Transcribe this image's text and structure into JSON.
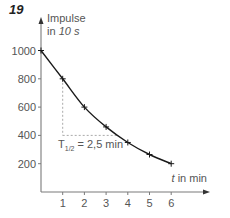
{
  "figure": {
    "number": "19"
  },
  "chart_data": {
    "type": "line",
    "title": "",
    "ylabel": "Impulse in 10 s",
    "ylabel_parts": {
      "main": "Impulse",
      "line2_prefix": "in ",
      "line2_italic": "10 s"
    },
    "xlabel": "t in min",
    "xlabel_parts": {
      "italic": "t",
      "rest": " in min"
    },
    "x": [
      0,
      1,
      2,
      3,
      4,
      5,
      6
    ],
    "values": [
      1000,
      800,
      600,
      460,
      350,
      265,
      200
    ],
    "xticks": [
      "1",
      "2",
      "3",
      "4",
      "5",
      "6"
    ],
    "yticks": [
      "200",
      "400",
      "600",
      "800",
      "1000"
    ],
    "xlim": [
      0,
      6.8
    ],
    "ylim": [
      0,
      1100
    ],
    "grid": false,
    "legend": null,
    "annotations": [
      {
        "text": "T½ = 2,5 min",
        "label_main": "T",
        "label_sub": "1/2",
        "label_rest": " = 2,5 min",
        "helper_lines": {
          "from_point": [
            1,
            800
          ],
          "to_level": 400,
          "to_x": 3.5
        }
      }
    ]
  }
}
